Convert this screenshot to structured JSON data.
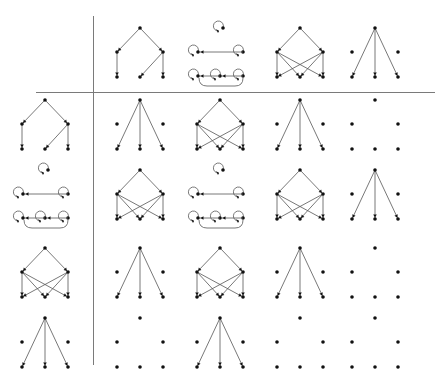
{
  "title": "Table of directed graphs",
  "colors": {
    "edge": "#555555",
    "node": "#111111",
    "rule": "#7a7a7a",
    "background": "#ffffff"
  },
  "graph_types": {
    "A": "tree",
    "B": "loop-components",
    "C": "bipartite-cross",
    "D": "star-with-isolated",
    "E": "empty"
  },
  "header_row": [
    "A",
    "B",
    "C",
    "D"
  ],
  "row_headers": [
    "A",
    "B",
    "C",
    "D"
  ],
  "grid": [
    [
      "D",
      "C",
      "D",
      "E"
    ],
    [
      "C",
      "B",
      "C",
      "D"
    ],
    [
      "D",
      "C",
      "D",
      "E"
    ],
    [
      "E",
      "D",
      "E",
      "E"
    ]
  ],
  "layout": {
    "col_x": [
      140,
      220,
      300,
      375
    ],
    "header_col_x": 45,
    "row_y": [
      20,
      92,
      162,
      240,
      310
    ],
    "h_rule": {
      "x1": 36,
      "x2": 435,
      "y": 92
    },
    "v_rule": {
      "x": 93,
      "y1": 16,
      "y2": 365
    }
  }
}
